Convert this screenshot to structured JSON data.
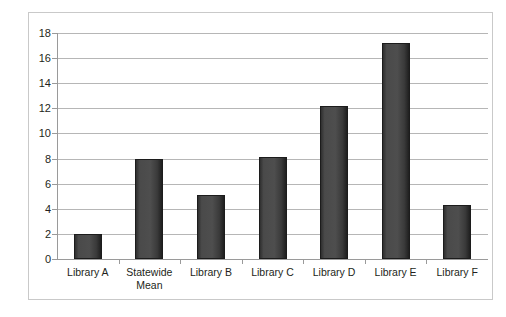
{
  "chart_data": {
    "type": "bar",
    "title": "",
    "subtitle": "",
    "xlabel": "",
    "ylabel": "",
    "categories": [
      "Library A",
      "Statewide\nMean",
      "Library B",
      "Library C",
      "Library D",
      "Library E",
      "Library F"
    ],
    "values": [
      2.0,
      8.0,
      5.1,
      8.1,
      12.2,
      17.2,
      4.3
    ],
    "series": [
      {
        "name": "Series 1",
        "values": [
          2.0,
          8.0,
          5.1,
          8.1,
          12.2,
          17.2,
          4.3
        ]
      }
    ],
    "ylim": [
      0,
      18
    ],
    "ytick_values": [
      0,
      2,
      4,
      6,
      8,
      10,
      12,
      14,
      16,
      18
    ],
    "ytick_labels": [
      "0",
      "2",
      "4",
      "6",
      "8",
      "10",
      "12",
      "14",
      "16",
      "18"
    ],
    "grid": "horizontal",
    "legend": "none",
    "bar_color": "#4a4a4a",
    "bar_border_color": "#1c1c1c",
    "gridline_color": "#b6b6b6",
    "axis_color": "#9a9a9a",
    "frame_color": "#c9c9c9",
    "background_color": "#ffffff",
    "text_color": "#231f20"
  }
}
